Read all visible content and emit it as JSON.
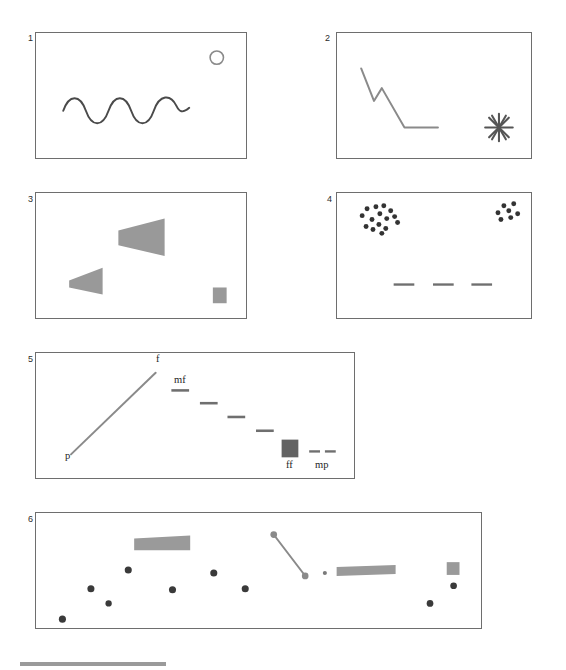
{
  "figure": {
    "background_color": "#ffffff",
    "stroke_color": "#6e6e6e",
    "ink_color": "#3a3a3a",
    "fill_gray": "#9a9a9a",
    "fill_dark_gray": "#636363"
  },
  "panels": [
    {
      "id": "panel-1",
      "number": "1",
      "x": 35,
      "y": 32,
      "w": 212,
      "h": 127,
      "elements": {
        "wave": {
          "name": "wavy-line",
          "x": 62,
          "y": 95,
          "w": 128,
          "h": 16,
          "cycles": 3.5
        },
        "circle": {
          "name": "circle-outline",
          "cx": 218,
          "cy": 57,
          "r": 7
        }
      }
    },
    {
      "id": "panel-2",
      "number": "2",
      "x": 336,
      "y": 32,
      "w": 196,
      "h": 127,
      "elements": {
        "zigzag": {
          "name": "descending-zigzag-line",
          "points": "360,68 373,101 381,88 404,128 438,128"
        },
        "asterisk": {
          "name": "asterisk-burst",
          "cx": 500,
          "cy": 128,
          "r": 14,
          "rays": 8
        }
      }
    },
    {
      "id": "panel-3",
      "number": "3",
      "x": 35,
      "y": 192,
      "w": 212,
      "h": 127,
      "elements": {
        "large_wedge": {
          "name": "large-wedge-shape",
          "points": "118,230 165,218 165,256 118,245"
        },
        "small_wedge": {
          "name": "small-wedge-shape",
          "points": "68,281 102,268 102,295 68,288"
        },
        "square": {
          "name": "gray-square",
          "x": 214,
          "y": 288,
          "w": 14,
          "h": 16
        }
      }
    },
    {
      "id": "panel-4",
      "number": "4",
      "x": 336,
      "y": 192,
      "w": 196,
      "h": 127,
      "elements": {
        "cluster_left": {
          "name": "dot-cluster-large",
          "count": 15,
          "dots": [
            [
              361,
              215
            ],
            [
              366,
              208
            ],
            [
              371,
              219
            ],
            [
              375,
              206
            ],
            [
              379,
              213
            ],
            [
              383,
              205
            ],
            [
              386,
              218
            ],
            [
              390,
              210
            ],
            [
              394,
              216
            ],
            [
              365,
              226
            ],
            [
              372,
              229
            ],
            [
              378,
              224
            ],
            [
              385,
              228
            ],
            [
              381,
              232
            ],
            [
              397,
              222
            ]
          ]
        },
        "cluster_right": {
          "name": "dot-cluster-small",
          "count": 7,
          "dots": [
            [
              499,
              212
            ],
            [
              505,
              205
            ],
            [
              510,
              210
            ],
            [
              515,
              203
            ],
            [
              512,
              217
            ],
            [
              502,
              219
            ],
            [
              519,
              213
            ]
          ]
        },
        "dashes": {
          "name": "horizontal-dashes",
          "items": [
            {
              "x": 393,
              "y": 285,
              "w": 21
            },
            {
              "x": 433,
              "y": 285,
              "w": 21
            },
            {
              "x": 472,
              "y": 285,
              "w": 21
            }
          ]
        }
      }
    },
    {
      "id": "panel-5",
      "number": "5",
      "x": 35,
      "y": 352,
      "w": 320,
      "h": 127,
      "elements": {
        "rising_line": {
          "name": "rising-diagonal-line",
          "x1": 69,
          "y1": 455,
          "x2": 155,
          "y2": 372
        },
        "label_p": {
          "name": "dynamic-label-p",
          "text": "p",
          "x": 64,
          "y": 457
        },
        "label_f": {
          "name": "dynamic-label-f",
          "text": "f",
          "x": 155,
          "y": 354
        },
        "label_mf": {
          "name": "dynamic-label-mf",
          "text": "mf",
          "x": 174,
          "y": 373
        },
        "label_ff": {
          "name": "dynamic-label-ff",
          "text": "ff",
          "x": 285,
          "y": 461
        },
        "label_mp": {
          "name": "dynamic-label-mp",
          "text": "mp",
          "x": 316,
          "y": 461
        },
        "descending_dashes": {
          "name": "descending-dashes",
          "items": [
            {
              "x": 171,
              "y": 390,
              "w": 18
            },
            {
              "x": 200,
              "y": 403,
              "w": 18
            },
            {
              "x": 228,
              "y": 417,
              "w": 18
            },
            {
              "x": 257,
              "y": 431,
              "w": 18
            }
          ]
        },
        "dark_square": {
          "name": "dark-gray-square",
          "x": 283,
          "y": 440,
          "w": 17,
          "h": 18
        },
        "mp_dashes": {
          "name": "mp-dashes",
          "items": [
            {
              "x": 311,
              "y": 452,
              "w": 11
            },
            {
              "x": 327,
              "y": 452,
              "w": 11
            }
          ]
        }
      }
    },
    {
      "id": "panel-6",
      "number": "6",
      "x": 35,
      "y": 512,
      "w": 447,
      "h": 117,
      "elements": {
        "dots": {
          "name": "scattered-dots",
          "items": [
            [
              59,
              620
            ],
            [
              88,
              589
            ],
            [
              106,
              604
            ],
            [
              126,
              570
            ],
            [
              171,
              590
            ],
            [
              213,
              573
            ],
            [
              245,
              589
            ],
            [
              313,
              579
            ],
            [
              433,
              604
            ],
            [
              457,
              586
            ]
          ]
        },
        "mini_dot": {
          "name": "tiny-dot",
          "x": 326,
          "y": 573,
          "r": 2
        },
        "bar_left": {
          "name": "tapered-bar-left",
          "points": "132,538 189,535 189,550 132,550"
        },
        "bar_right": {
          "name": "tapered-bar-right",
          "points": "338,567 398,565 398,574 338,576"
        },
        "diagonal": {
          "name": "diagonal-connector-line",
          "x1": 274,
          "y1": 534,
          "x2": 306,
          "y2": 576
        },
        "diag_dot_top": {
          "name": "diagonal-endpoint-dot-top",
          "cx": 274,
          "cy": 534,
          "r": 3.4
        },
        "diag_dot_bottom": {
          "name": "diagonal-endpoint-dot-bottom",
          "cx": 306,
          "cy": 576,
          "r": 3.4
        },
        "square": {
          "name": "gray-square",
          "x": 450,
          "y": 562,
          "w": 13,
          "h": 13
        }
      }
    }
  ],
  "bottom_rule": {
    "name": "scale-bar",
    "x": 20,
    "y": 662,
    "w": 146,
    "h": 4
  }
}
